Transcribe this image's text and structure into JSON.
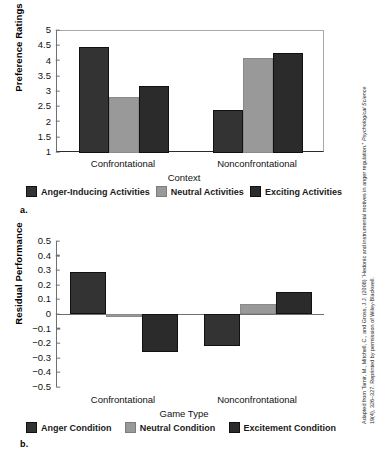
{
  "figure": {
    "panel_a_letter": "a.",
    "panel_b_letter": "b.",
    "attribution_line1": "Adapted from Tamir, M., Mitchell, C., and Gross, J.J. (2008) “Hedonic and instrumental motives in anger regulation.”",
    "attribution_line1_italic": "Psychological Science",
    "attribution_line2": "19(4), 326–327. Reprinted by permission of Wiley-Blackwell."
  },
  "colors": {
    "dark": "#333333",
    "darker": "#2b2b2b",
    "gray": "#999999",
    "axis": "#6f6f6f",
    "text": "#111111"
  },
  "chart_data": [
    {
      "type": "bar",
      "title": "",
      "panel": "a.",
      "xlabel": "Context",
      "ylabel": "Preference Ratings",
      "categories": [
        "Confrontational",
        "Nonconfrontational"
      ],
      "ylim": [
        1,
        5
      ],
      "yticks": [
        "5",
        "4.5",
        "4",
        "3.5",
        "3",
        "2.5",
        "2",
        "1.5",
        "1"
      ],
      "ytick_values": [
        5,
        4.5,
        4,
        3.5,
        3,
        2.5,
        2,
        1.5,
        1
      ],
      "grid": false,
      "legend_position": "bottom",
      "series": [
        {
          "name": "Anger-Inducing Activities",
          "color": "#333333",
          "values": [
            4.47,
            2.41
          ]
        },
        {
          "name": "Neutral Activities",
          "color": "#999999",
          "values": [
            2.85,
            4.12
          ]
        },
        {
          "name": "Exciting Activities",
          "color": "#2b2b2b",
          "values": [
            3.2,
            4.28
          ]
        }
      ]
    },
    {
      "type": "bar",
      "title": "",
      "panel": "b.",
      "xlabel": "Game Type",
      "ylabel": "Residual Performance",
      "categories": [
        "Confrontational",
        "Nonconfrontational"
      ],
      "ylim": [
        -0.5,
        0.5
      ],
      "yticks": [
        "0.5",
        "0.4",
        "0.3",
        "0.2",
        "0.1",
        "0",
        "−0.1",
        "−0.2",
        "−0.3",
        "−0.4",
        "−0.5"
      ],
      "ytick_values": [
        0.5,
        0.4,
        0.3,
        0.2,
        0.1,
        0,
        -0.1,
        -0.2,
        -0.3,
        -0.4,
        -0.5
      ],
      "grid": false,
      "legend_position": "bottom",
      "series": [
        {
          "name": "Anger Condition",
          "color": "#333333",
          "values": [
            0.29,
            -0.22
          ]
        },
        {
          "name": "Neutral Condition",
          "color": "#999999",
          "values": [
            -0.02,
            0.07
          ]
        },
        {
          "name": "Excitement Condition",
          "color": "#2b2b2b",
          "values": [
            -0.26,
            0.15
          ]
        }
      ]
    }
  ]
}
